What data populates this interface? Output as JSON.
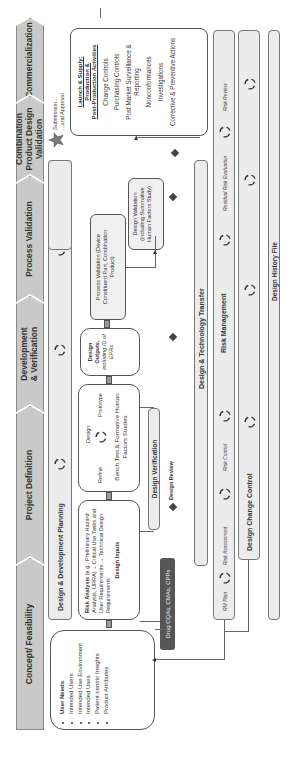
{
  "phases": [
    {
      "label": "Concept/ Feasibility"
    },
    {
      "label": "Project Definition"
    },
    {
      "label": "Development & Verification"
    },
    {
      "label": "Process Validation"
    },
    {
      "label": "Combination Product Design Validation"
    },
    {
      "label": "Commercialization"
    }
  ],
  "planning_bar": {
    "label": "Design & Development Planning"
  },
  "user_needs": {
    "items": [
      "User Needs",
      "Intended Users",
      "Intended Use Environment",
      "Intended Uses",
      "Patient-centric Insights",
      "Product Attributes"
    ]
  },
  "design_inputs": {
    "bold_lead": "Risk Analysis",
    "text": "(e.g., Preliminary Hazard Analysis, URRA)→ Critical Use Tasks and User Requirements → Technical Design Requirements",
    "title": "Design Inputs"
  },
  "bench_test": {
    "design": "Design",
    "refine": "Refine",
    "prototype": "Prototype",
    "text": "Bench Test & Formative Human Factors Studies"
  },
  "design_outputs": {
    "title": "Design Outputs,",
    "note": "including ID of EPRs"
  },
  "process_validation_box": {
    "text": "Process Validation (Device Constituent Part, Combination Product)"
  },
  "design_validation_box": {
    "text": "Design Validation (including Summative Human Factors Study)"
  },
  "design_verification": {
    "label": "Design Verification"
  },
  "design_review": {
    "label": "Design Review"
  },
  "drug_box": {
    "label": "Drug CQAs, CMAs, CPPs"
  },
  "submission": {
    "line1": "Submission...",
    "line2": "...and Approval"
  },
  "launch": {
    "title_lines": [
      "Launch & Supply:",
      "Production &",
      "Post-Production Activities"
    ],
    "items": [
      "Change Controls",
      "Purchasing Controls",
      "Post Market Surveillance & Reporting",
      "Nonconformances",
      "Investigations",
      "Corrective & Preventive Actions"
    ]
  },
  "tech_transfer": {
    "label": "Design & Technology Transfer"
  },
  "risk_management": {
    "label": "Risk Management",
    "steps": [
      "RM Plan",
      "Risk Assessment",
      "Risk Control",
      "Residual Risk Evaluation",
      "Risk Review"
    ]
  },
  "design_change_control": {
    "label": "Design Change Control"
  },
  "dhf": {
    "label": "Design History File"
  },
  "colors": {
    "chevron": "#c9c9c9",
    "bar": "#ececec",
    "drug_box": "#555555",
    "star": "#7a7a7a"
  }
}
